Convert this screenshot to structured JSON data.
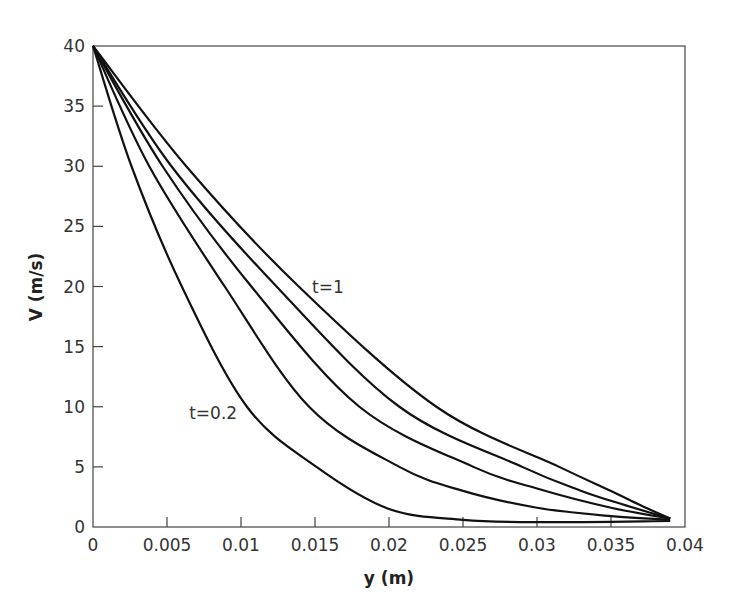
{
  "chart_data": {
    "type": "line",
    "title": "",
    "xlabel": "y (m)",
    "ylabel": "V (m/s)",
    "xlim": [
      0,
      0.04
    ],
    "ylim": [
      0,
      40
    ],
    "xticks": [
      "0",
      "0.005",
      "0.01",
      "0.015",
      "0.02",
      "0.025",
      "0.03",
      "0.035",
      "0.04"
    ],
    "yticks": [
      "0",
      "5",
      "10",
      "15",
      "20",
      "25",
      "30",
      "35",
      "40"
    ],
    "grid": false,
    "legend": null,
    "annotations": [
      {
        "text": "t=1",
        "x": 0.0148,
        "y": 19.5
      },
      {
        "text": "t=0.2",
        "x": 0.0065,
        "y": 9.0
      }
    ],
    "series": [
      {
        "name": "t=0.2",
        "x": [
          0,
          0.0026,
          0.006,
          0.0104,
          0.0151,
          0.02,
          0.025,
          0.03,
          0.039
        ],
        "y": [
          40,
          30,
          20,
          10,
          5,
          1.5,
          0.6,
          0.4,
          0.5
        ]
      },
      {
        "name": "t=0.4",
        "x": [
          0,
          0.0038,
          0.0089,
          0.0146,
          0.0207,
          0.025,
          0.03,
          0.035,
          0.039
        ],
        "y": [
          40,
          30,
          20,
          10,
          5,
          3,
          1.6,
          0.9,
          0.6
        ]
      },
      {
        "name": "t=0.6",
        "x": [
          0,
          0.0047,
          0.0107,
          0.018,
          0.0257,
          0.03,
          0.035,
          0.039
        ],
        "y": [
          40,
          30,
          20,
          10,
          5,
          3.2,
          1.6,
          0.7
        ]
      },
      {
        "name": "t=0.8",
        "x": [
          0,
          0.0053,
          0.0124,
          0.0207,
          0.029,
          0.033,
          0.036,
          0.039
        ],
        "y": [
          40,
          30,
          20,
          10,
          5,
          3.0,
          1.8,
          0.7
        ]
      },
      {
        "name": "t=1",
        "x": [
          0,
          0.0063,
          0.0139,
          0.0232,
          0.0315,
          0.035,
          0.037,
          0.039
        ],
        "y": [
          40,
          30,
          20,
          10,
          5,
          3.0,
          1.8,
          0.7
        ]
      }
    ]
  }
}
